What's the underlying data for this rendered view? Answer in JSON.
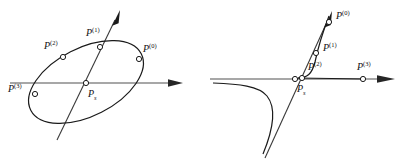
{
  "figure": {
    "caption": "",
    "colors": {
      "axis": "#8a8a8a",
      "curve": "#1a1a1a",
      "ray": "#2b2b2b",
      "marker_stroke": "#1a1a1a",
      "marker_fill": "#ffffff",
      "label_text": "#111111",
      "background": "#ffffff"
    },
    "panels": [
      {
        "id": "left-panel",
        "name": "ellipse-panel",
        "description": "Ellipse intersected by a horizontal axis and a slanted ray",
        "shapes": [
          {
            "name": "horizontal-axis-arrow",
            "kind": "axis",
            "style": "gray-arrow"
          },
          {
            "name": "slanted-ray-arrow",
            "kind": "ray",
            "style": "dark-arrow"
          },
          {
            "name": "ellipse-curve",
            "kind": "conic",
            "conic_type": "ellipse"
          }
        ],
        "points": [
          {
            "name": "point-p0",
            "label": "P",
            "superscript": "(0)",
            "subscript": ""
          },
          {
            "name": "point-p1",
            "label": "P",
            "superscript": "(1)",
            "subscript": ""
          },
          {
            "name": "point-p2",
            "label": "P",
            "superscript": "(2)",
            "subscript": ""
          },
          {
            "name": "point-p3",
            "label": "P",
            "superscript": "(3)",
            "subscript": ""
          },
          {
            "name": "point-ps",
            "label": "P",
            "superscript": "",
            "subscript": "s"
          }
        ]
      },
      {
        "id": "right-panel",
        "name": "hyperbola-panel",
        "description": "Hyperbola with two branches, a horizontal axis and a slanted ray through Ps",
        "shapes": [
          {
            "name": "horizontal-axis-arrow",
            "kind": "axis",
            "style": "gray-arrow"
          },
          {
            "name": "slanted-ray-arrow",
            "kind": "ray",
            "style": "dark-arrow"
          },
          {
            "name": "hyperbola-upper-branch",
            "kind": "conic",
            "conic_type": "hyperbola"
          },
          {
            "name": "hyperbola-lower-branch",
            "kind": "conic",
            "conic_type": "hyperbola"
          }
        ],
        "points": [
          {
            "name": "point-p0",
            "label": "P",
            "superscript": "(0)",
            "subscript": ""
          },
          {
            "name": "point-p1",
            "label": "P",
            "superscript": "(1)",
            "subscript": ""
          },
          {
            "name": "point-p2",
            "label": "P",
            "superscript": "(2)",
            "subscript": ""
          },
          {
            "name": "point-p3",
            "label": "P",
            "superscript": "(3)",
            "subscript": ""
          },
          {
            "name": "point-ps",
            "label": "P",
            "superscript": "",
            "subscript": "s"
          }
        ]
      }
    ]
  }
}
